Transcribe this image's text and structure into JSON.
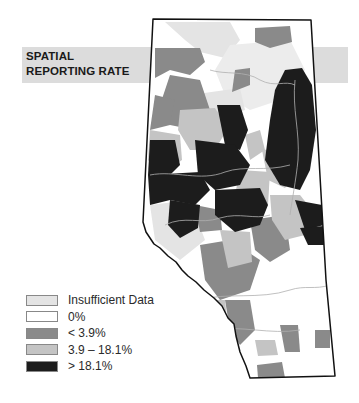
{
  "title": {
    "line1": "SPATIAL",
    "line2": "REPORTING RATE"
  },
  "legend": {
    "items": [
      {
        "label": "Insufficient Data",
        "color": "#e4e4e4"
      },
      {
        "label": "0%",
        "color": "#ffffff"
      },
      {
        "label": "< 3.9%",
        "color": "#8a8a8a"
      },
      {
        "label": "3.9 – 18.1%",
        "color": "#c4c4c4"
      },
      {
        "label": "> 18.1%",
        "color": "#1c1c1c"
      }
    ]
  },
  "colors": {
    "band": "#dcdcdc",
    "border": "#111111",
    "rivers": "#b0b0b0"
  }
}
